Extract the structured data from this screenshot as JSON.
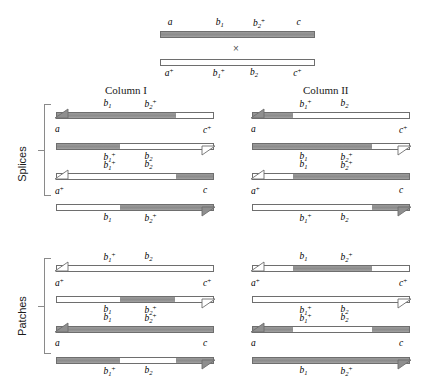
{
  "figure": {
    "cross_symbol": "×",
    "colors": {
      "gray_allele": "#8f8f8f",
      "white_allele": "#ffffff",
      "outline": "#6e6e6e",
      "text": "#1a1a1a"
    }
  },
  "headers": {
    "column_one": "Column I",
    "column_two": "Column II"
  },
  "side_labels": {
    "splices": "Splices",
    "patches": "Patches"
  },
  "parents": {
    "top": {
      "labels": [
        "a",
        "b₁",
        "b₂⁺",
        "c"
      ],
      "label_parts": [
        {
          "base": "a",
          "sub": "",
          "sup": ""
        },
        {
          "base": "b",
          "sub": "1",
          "sup": ""
        },
        {
          "base": "b",
          "sub": "2",
          "sup": "+"
        },
        {
          "base": "c",
          "sub": "",
          "sup": ""
        }
      ],
      "fill": "gray"
    },
    "bottom": {
      "labels": [
        "a⁺",
        "b₁⁺",
        "b₂",
        "c⁺"
      ],
      "label_parts": [
        {
          "base": "a",
          "sub": "",
          "sup": "+"
        },
        {
          "base": "b",
          "sub": "1",
          "sup": "+"
        },
        {
          "base": "b",
          "sub": "2",
          "sup": ""
        },
        {
          "base": "c",
          "sub": "",
          "sup": ""
        }
      ],
      "fill": "white"
    }
  },
  "splices": {
    "column_one": {
      "pair_one": {
        "top_labels_above": [
          {
            "base": "b",
            "sub": "1",
            "sup": ""
          },
          {
            "base": "b",
            "sub": "2",
            "sup": "+"
          }
        ],
        "end_label_left": {
          "base": "a",
          "sub": "",
          "sup": ""
        },
        "end_label_right": {
          "base": "c",
          "sub": "",
          "sup": "+"
        },
        "bottom_labels_below": [
          {
            "base": "b",
            "sub": "1",
            "sup": "+"
          },
          {
            "base": "b",
            "sub": "2",
            "sup": ""
          }
        ],
        "top_segments": [
          {
            "from": 0,
            "to": 75,
            "fill": "gray"
          }
        ],
        "bottom_segments": [
          {
            "from": 0,
            "to": 40,
            "fill": "gray"
          }
        ],
        "top_arrow": "left-filled",
        "bottom_arrow": "right-open"
      },
      "pair_two": {
        "top_labels_above": [
          {
            "base": "b",
            "sub": "1",
            "sup": "+"
          },
          {
            "base": "b",
            "sub": "2",
            "sup": ""
          }
        ],
        "end_label_left": {
          "base": "a",
          "sub": "",
          "sup": "+"
        },
        "end_label_right": {
          "base": "c",
          "sub": "",
          "sup": ""
        },
        "bottom_labels_below": [
          {
            "base": "b",
            "sub": "1",
            "sup": ""
          },
          {
            "base": "b",
            "sub": "2",
            "sup": "+"
          }
        ],
        "top_segments": [
          {
            "from": 75,
            "to": 100,
            "fill": "gray"
          }
        ],
        "bottom_segments": [
          {
            "from": 40,
            "to": 100,
            "fill": "gray"
          }
        ],
        "top_arrow": "left-open",
        "bottom_arrow": "right-filled"
      }
    },
    "column_two": {
      "pair_one": {
        "top_labels_above": [
          {
            "base": "b",
            "sub": "1",
            "sup": "+"
          },
          {
            "base": "b",
            "sub": "2",
            "sup": ""
          }
        ],
        "end_label_left": {
          "base": "a",
          "sub": "",
          "sup": ""
        },
        "end_label_right": {
          "base": "c",
          "sub": "",
          "sup": "+"
        },
        "bottom_labels_below": [
          {
            "base": "b",
            "sub": "1",
            "sup": ""
          },
          {
            "base": "b",
            "sub": "2",
            "sup": "+"
          }
        ],
        "top_segments": [
          {
            "from": 0,
            "to": 25,
            "fill": "gray"
          }
        ],
        "bottom_segments": [
          {
            "from": 0,
            "to": 75,
            "fill": "gray"
          }
        ],
        "top_arrow": "left-filled",
        "bottom_arrow": "right-open"
      },
      "pair_two": {
        "top_labels_above": [
          {
            "base": "b",
            "sub": "1",
            "sup": ""
          },
          {
            "base": "b",
            "sub": "2",
            "sup": "+"
          }
        ],
        "end_label_left": {
          "base": "a",
          "sub": "",
          "sup": "+"
        },
        "end_label_right": {
          "base": "c",
          "sub": "",
          "sup": ""
        },
        "bottom_labels_below": [
          {
            "base": "b",
            "sub": "1",
            "sup": "+"
          },
          {
            "base": "b",
            "sub": "2",
            "sup": ""
          }
        ],
        "top_segments": [
          {
            "from": 25,
            "to": 100,
            "fill": "gray"
          }
        ],
        "bottom_segments": [
          {
            "from": 75,
            "to": 100,
            "fill": "gray"
          }
        ],
        "top_arrow": "left-open",
        "bottom_arrow": "right-filled"
      }
    }
  },
  "patches": {
    "column_one": {
      "pair_one": {
        "top_labels_above": [
          {
            "base": "b",
            "sub": "1",
            "sup": "+"
          },
          {
            "base": "b",
            "sub": "2",
            "sup": ""
          }
        ],
        "end_label_left": {
          "base": "a",
          "sub": "",
          "sup": "+"
        },
        "end_label_right": {
          "base": "c",
          "sub": "",
          "sup": "+"
        },
        "bottom_labels_below": [
          {
            "base": "b",
            "sub": "1",
            "sup": ""
          },
          {
            "base": "b",
            "sub": "2",
            "sup": "+"
          }
        ],
        "top_segments": [],
        "bottom_segments": [
          {
            "from": 40,
            "to": 75,
            "fill": "gray"
          }
        ],
        "top_arrow": "left-open",
        "bottom_arrow": "right-open"
      },
      "pair_two": {
        "top_labels_above": [
          {
            "base": "b",
            "sub": "1",
            "sup": ""
          },
          {
            "base": "b",
            "sub": "2",
            "sup": "+"
          }
        ],
        "end_label_left": {
          "base": "a",
          "sub": "",
          "sup": ""
        },
        "end_label_right": {
          "base": "c",
          "sub": "",
          "sup": ""
        },
        "bottom_labels_below": [
          {
            "base": "b",
            "sub": "1",
            "sup": "+"
          },
          {
            "base": "b",
            "sub": "2",
            "sup": ""
          }
        ],
        "top_segments": [
          {
            "from": 0,
            "to": 100,
            "fill": "gray"
          }
        ],
        "bottom_segments": [
          {
            "from": 0,
            "to": 40,
            "fill": "gray"
          },
          {
            "from": 75,
            "to": 100,
            "fill": "gray"
          }
        ],
        "top_arrow": "left-filled",
        "bottom_arrow": "right-filled"
      }
    },
    "column_two": {
      "pair_one": {
        "top_labels_above": [
          {
            "base": "b",
            "sub": "1",
            "sup": ""
          },
          {
            "base": "b",
            "sub": "2",
            "sup": "+"
          }
        ],
        "end_label_left": {
          "base": "a",
          "sub": "",
          "sup": "+"
        },
        "end_label_right": {
          "base": "c",
          "sub": "",
          "sup": "+"
        },
        "bottom_labels_below": [
          {
            "base": "b",
            "sub": "1",
            "sup": "+"
          },
          {
            "base": "b",
            "sub": "2",
            "sup": ""
          }
        ],
        "top_segments": [
          {
            "from": 25,
            "to": 75,
            "fill": "gray"
          }
        ],
        "bottom_segments": [],
        "top_arrow": "left-open",
        "bottom_arrow": "right-open"
      },
      "pair_two": {
        "top_labels_above": [
          {
            "base": "b",
            "sub": "1",
            "sup": "+"
          },
          {
            "base": "b",
            "sub": "2",
            "sup": ""
          }
        ],
        "end_label_left": {
          "base": "a",
          "sub": "",
          "sup": ""
        },
        "end_label_right": {
          "base": "c",
          "sub": "",
          "sup": ""
        },
        "bottom_labels_below": [
          {
            "base": "b",
            "sub": "1",
            "sup": ""
          },
          {
            "base": "b",
            "sub": "2",
            "sup": "+"
          }
        ],
        "top_segments": [
          {
            "from": 0,
            "to": 25,
            "fill": "gray"
          },
          {
            "from": 75,
            "to": 100,
            "fill": "gray"
          }
        ],
        "bottom_segments": [
          {
            "from": 0,
            "to": 100,
            "fill": "gray"
          }
        ],
        "top_arrow": "left-filled",
        "bottom_arrow": "right-filled"
      }
    }
  }
}
